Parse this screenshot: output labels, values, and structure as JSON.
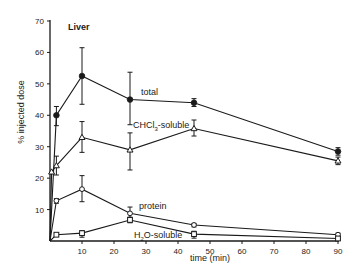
{
  "chart_data": {
    "type": "line",
    "title": "Liver",
    "xlabel": "time (min)",
    "ylabel": "% injected dose",
    "xlim": [
      0,
      90
    ],
    "ylim": [
      0,
      70
    ],
    "xticks": [
      10,
      20,
      30,
      40,
      50,
      60,
      70,
      80,
      90
    ],
    "yticks": [
      10,
      20,
      30,
      40,
      50,
      60,
      70
    ],
    "grid": false,
    "legend": "inline labels",
    "series": [
      {
        "name": "total",
        "label": "total",
        "marker": "filled-circle",
        "x": [
          0,
          2,
          10,
          25,
          45,
          90
        ],
        "values": [
          0,
          40,
          52.5,
          45,
          44,
          28.5
        ],
        "err_low": [
          null,
          36.7,
          43.5,
          37,
          42.8,
          27.3
        ],
        "err_high": [
          null,
          42.8,
          61.5,
          53.7,
          45.3,
          29.7
        ],
        "label_pos": [
          29,
          46.5
        ]
      },
      {
        "name": "CHCl3-soluble",
        "label": "CHCl3-soluble",
        "marker": "open-triangle",
        "x": [
          0,
          0.5,
          2,
          10,
          25,
          45,
          90
        ],
        "values": [
          0,
          22,
          24,
          33,
          29,
          35.8,
          25.5
        ],
        "err_low": [
          null,
          null,
          21,
          28.2,
          22.6,
          33.4,
          24.3
        ],
        "err_high": [
          null,
          null,
          27,
          38,
          34.4,
          38.5,
          26.7
        ],
        "label_pos": [
          25.5,
          36
        ]
      },
      {
        "name": "protein",
        "label": "protein",
        "marker": "open-circle",
        "x": [
          0,
          2,
          10,
          25,
          45,
          90
        ],
        "values": [
          0,
          12.8,
          16.5,
          8.8,
          5.1,
          2
        ],
        "err_low": [
          null,
          12,
          12.5,
          7.2,
          4.5,
          1.5
        ],
        "err_high": [
          null,
          13.5,
          20.8,
          10.8,
          5.6,
          2.5
        ],
        "label_pos": [
          28,
          10.8
        ]
      },
      {
        "name": "H2O-soluble",
        "label": "H2O-soluble",
        "marker": "open-square",
        "x": [
          0,
          2,
          10,
          25,
          45,
          90
        ],
        "values": [
          0,
          2,
          2.5,
          6.7,
          2.2,
          0.8
        ],
        "err_low": [
          null,
          1.6,
          1.2,
          5.8,
          0.9,
          0.4
        ],
        "err_high": [
          null,
          2.4,
          3.3,
          7.6,
          3.1,
          1.2
        ],
        "label_pos": [
          26.5,
          1.5
        ]
      }
    ]
  },
  "labels": {
    "title": "Liver",
    "xlabel": "time (min)",
    "ylabel": "% injected dose",
    "series_total": "total",
    "series_chcl3_main": "CHCl",
    "series_chcl3_sub": "3",
    "series_chcl3_rest": "-soluble",
    "series_protein": "protein",
    "series_h2o_pre": "H",
    "series_h2o_sub": "2",
    "series_h2o_rest": "O-soluble"
  }
}
